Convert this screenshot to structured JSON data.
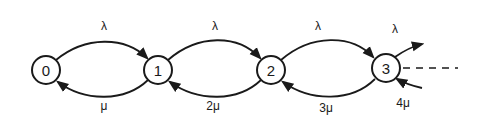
{
  "diagram": {
    "type": "birth-death state transition diagram",
    "colors": {
      "ink": "#1a1a1a",
      "background": "#ffffff"
    },
    "states": [
      {
        "id": "0",
        "label": "0"
      },
      {
        "id": "1",
        "label": "1"
      },
      {
        "id": "2",
        "label": "2"
      },
      {
        "id": "3",
        "label": "3"
      }
    ],
    "forward_transitions": [
      {
        "from": "0",
        "to": "1",
        "label": "λ"
      },
      {
        "from": "1",
        "to": "2",
        "label": "λ"
      },
      {
        "from": "2",
        "to": "3",
        "label": "λ"
      },
      {
        "from": "3",
        "to": "…",
        "label": "λ"
      }
    ],
    "backward_transitions": [
      {
        "from": "1",
        "to": "0",
        "label": "μ"
      },
      {
        "from": "2",
        "to": "1",
        "label": "2μ"
      },
      {
        "from": "3",
        "to": "2",
        "label": "3μ"
      },
      {
        "from": "…",
        "to": "3",
        "label": "4μ"
      }
    ],
    "continuation": "dashed line indicating further states"
  }
}
